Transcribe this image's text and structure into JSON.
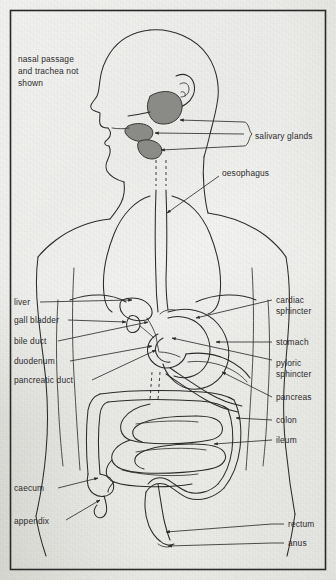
{
  "figure": {
    "background_color": "#d9d9d4",
    "ink_color": "#2b2b2b",
    "organ_shade_color": "#8a8a86",
    "border": {
      "present": true,
      "inset_px": 10
    }
  },
  "note": {
    "name": "nasal-passage-note",
    "lines": [
      "nasal passage",
      "and trachea not",
      "shown"
    ]
  },
  "labels": {
    "salivary_glands": "salivary glands",
    "oesophagus": "oesophagus",
    "liver": "liver",
    "gall_bladder": "gall bladder",
    "bile_duct": "bile duct",
    "duodenum": "duodenum",
    "pancreatic_duct": "pancreatic duct",
    "cardiac_sphincter_line1": "cardiac",
    "cardiac_sphincter_line2": "sphincter",
    "stomach": "stomach",
    "pyloric_sphincter_line1": "pyloric",
    "pyloric_sphincter_line2": "sphincter",
    "pancreas": "pancreas",
    "colon": "colon",
    "ileum": "ileum",
    "caecum": "caecum",
    "appendix": "appendix",
    "rectum": "rectum",
    "anus": "anus"
  },
  "label_list": [
    {
      "id": "salivary-glands",
      "text": "salivary glands",
      "side": "right",
      "x": 255,
      "y": 136
    },
    {
      "id": "oesophagus",
      "text": "oesophagus",
      "side": "right",
      "x": 222,
      "y": 173
    },
    {
      "id": "liver",
      "text": "liver",
      "side": "left",
      "x": 14,
      "y": 305
    },
    {
      "id": "gall-bladder",
      "text": "gall bladder",
      "side": "left",
      "x": 14,
      "y": 323
    },
    {
      "id": "bile-duct",
      "text": "bile duct",
      "side": "left",
      "x": 14,
      "y": 344
    },
    {
      "id": "duodenum",
      "text": "duodenum",
      "side": "left",
      "x": 14,
      "y": 364
    },
    {
      "id": "pancreatic-duct",
      "text": "pancreatic duct",
      "side": "left",
      "x": 14,
      "y": 383
    },
    {
      "id": "cardiac-sphincter",
      "text": "cardiac sphincter",
      "side": "right",
      "x": 276,
      "y": 306
    },
    {
      "id": "stomach",
      "text": "stomach",
      "side": "right",
      "x": 276,
      "y": 342
    },
    {
      "id": "pyloric-sphincter",
      "text": "pyloric sphincter",
      "side": "right",
      "x": 276,
      "y": 362
    },
    {
      "id": "pancreas",
      "text": "pancreas",
      "side": "right",
      "x": 276,
      "y": 398
    },
    {
      "id": "colon",
      "text": "colon",
      "side": "right",
      "x": 276,
      "y": 420
    },
    {
      "id": "ileum",
      "text": "ileum",
      "side": "right",
      "x": 276,
      "y": 441
    },
    {
      "id": "caecum",
      "text": "caecum",
      "side": "left",
      "x": 14,
      "y": 491
    },
    {
      "id": "appendix",
      "text": "appendix",
      "side": "left",
      "x": 14,
      "y": 524
    },
    {
      "id": "rectum",
      "text": "rectum",
      "side": "right",
      "x": 288,
      "y": 526
    },
    {
      "id": "anus",
      "text": "anus",
      "side": "right",
      "x": 288,
      "y": 545
    }
  ]
}
